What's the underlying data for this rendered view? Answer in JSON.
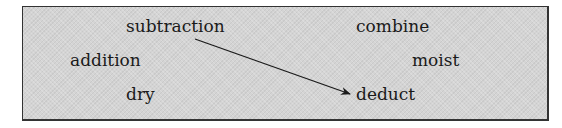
{
  "diagram": {
    "words": [
      {
        "id": "subtraction",
        "text": "subtraction",
        "x": 126,
        "y": 18
      },
      {
        "id": "combine",
        "text": "combine",
        "x": 356,
        "y": 18
      },
      {
        "id": "addition",
        "text": "addition",
        "x": 70,
        "y": 52
      },
      {
        "id": "moist",
        "text": "moist",
        "x": 412,
        "y": 52
      },
      {
        "id": "dry",
        "text": "dry",
        "x": 126,
        "y": 86
      },
      {
        "id": "deduct",
        "text": "deduct",
        "x": 356,
        "y": 86
      }
    ],
    "connections": [
      {
        "from": "subtraction",
        "to": "deduct"
      }
    ],
    "colors": {
      "background": "#d4d4d4",
      "border": "#333333",
      "text": "#1a1a1a",
      "arrow": "#1a1a1a"
    }
  }
}
